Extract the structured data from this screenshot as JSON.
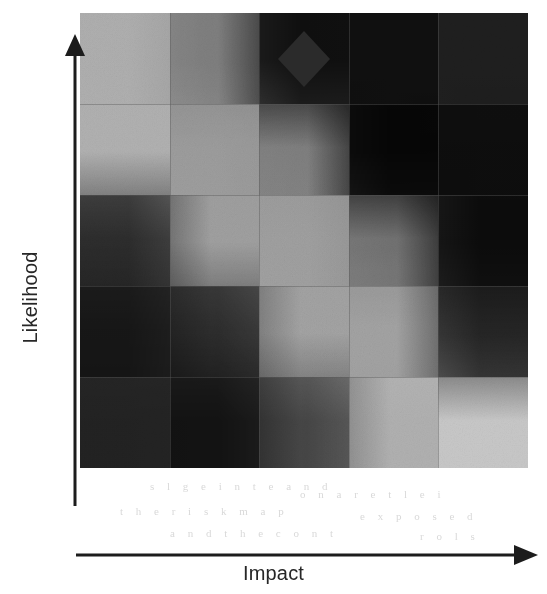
{
  "figure": {
    "type": "risk-heat-map",
    "x_axis_label": "Impact",
    "y_axis_label": "Likelihood"
  },
  "chart_data": {
    "type": "heatmap",
    "title": "",
    "subtitle": "",
    "xlabel": "Impact",
    "ylabel": "Likelihood",
    "grid": true,
    "legend": "none",
    "axis_style": "arrow",
    "colormap": "grayscale",
    "colormap_note": "dark = high risk, light = low risk",
    "rows": 5,
    "columns": 5,
    "x": [
      "1",
      "2",
      "3",
      "4",
      "5"
    ],
    "categories": [
      "1",
      "2",
      "3",
      "4",
      "5"
    ],
    "row_order": "top row = highest likelihood",
    "xlim": [
      0,
      5
    ],
    "ylim": [
      0,
      5
    ],
    "cell_shades": [
      [
        "#e1e1e1",
        "#d6d6d6",
        "#7f7f7f",
        "#808080",
        "#7e7e7e"
      ],
      [
        "#e2e2e2",
        "#e2e2e2",
        "#dedede",
        "#797979",
        "#7b7b7b"
      ],
      [
        "#a5a5a5",
        "#e3e3e3",
        "#e3e3e3",
        "#d9d9d9",
        "#767676"
      ],
      [
        "#8b8b8b",
        "#b4b4b4",
        "#e4e4e4",
        "#e4e4e4",
        "#9d9d9d"
      ],
      [
        "#838383",
        "#858585",
        "#b9b9b9",
        "#e2e2e2",
        "#e2e2e2"
      ]
    ],
    "values": [
      [
        1,
        2,
        4,
        5,
        5
      ],
      [
        1,
        1,
        2,
        4,
        5
      ],
      [
        1,
        1,
        2,
        3,
        5
      ],
      [
        1,
        1,
        1,
        2,
        4
      ],
      [
        1,
        1,
        1,
        1,
        2
      ]
    ],
    "gridline_color": "#5a5a5a",
    "annotations": [
      {
        "name": "risk-marker",
        "shape": "diamond",
        "color": "#2b2b2b",
        "x": 3,
        "y": 5,
        "label": ""
      }
    ]
  },
  "bleed_text": [
    {
      "text": "s l g e i n t e a n d",
      "x": 150,
      "y": 480
    },
    {
      "text": "o n a r e t l e i",
      "x": 300,
      "y": 488
    },
    {
      "text": "t h e r i s k m a p",
      "x": 120,
      "y": 505
    },
    {
      "text": "e x p o s e d",
      "x": 360,
      "y": 510
    },
    {
      "text": "a n d t h e c o n t",
      "x": 170,
      "y": 527
    },
    {
      "text": "r o l s",
      "x": 420,
      "y": 530
    }
  ]
}
